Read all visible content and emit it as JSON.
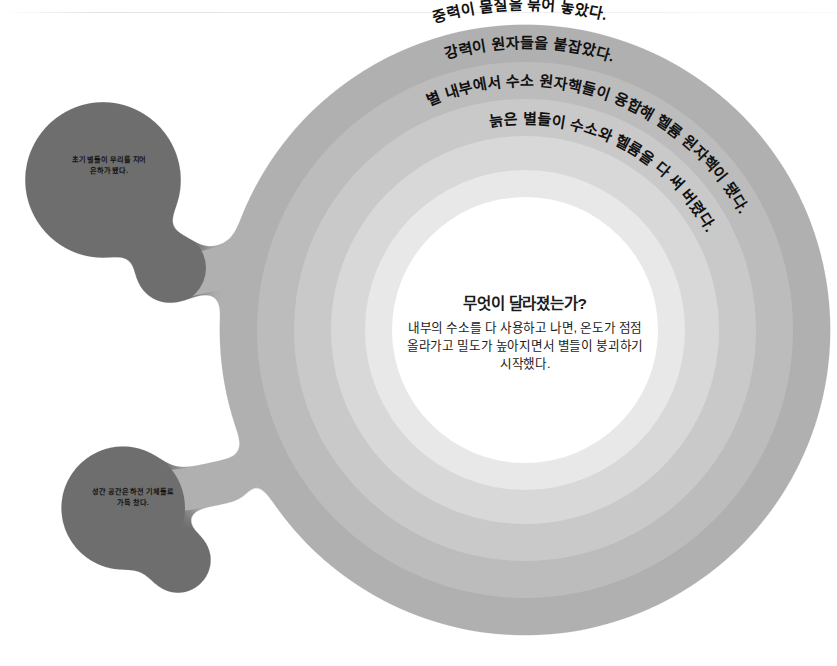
{
  "diagram": {
    "type": "concentric-ring-infographic",
    "title_center": "무엇이 달라졌는가?",
    "center_body": [
      "내부의 수소를 다 사용하고 나면, 온도가 점점",
      "올라가고 밀도가 높아지면서 별들이 붕괴하기",
      "시작했다."
    ],
    "ring_labels": [
      {
        "id": "ring-1",
        "text": "중력이 물질을 묶어 놓았다."
      },
      {
        "id": "ring-2",
        "text": "강력이 원자들을 붙잡았다."
      },
      {
        "id": "ring-3",
        "text": "별 내부에서 수소 원자핵들이 융합해 헬륨 원자핵이 됐다."
      },
      {
        "id": "ring-4",
        "text": "늙은 별들이 수소와 헬륨을 다 써 버렸다."
      }
    ],
    "bubbles": [
      {
        "id": "bubble-1",
        "lines": [
          "초기 별들이 무리를 지어",
          "은하가 됐다."
        ]
      },
      {
        "id": "bubble-2",
        "lines": [
          "성간 공간은 하전 기체들로",
          "가득 찼다."
        ]
      }
    ],
    "colors": {
      "background": "#ffffff",
      "ring_1_outer": "#b0b0b0",
      "ring_2": "#bcbcbc",
      "ring_3": "#c9c9c9",
      "ring_4": "#d8d8d8",
      "ring_5": "#e8e8e8",
      "ring_core": "#ffffff",
      "bubble_fill": "#6e6e6e",
      "bubble_text": "#131313",
      "center_text": "#1b1b1b"
    }
  }
}
